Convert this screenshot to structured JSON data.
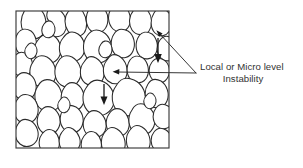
{
  "figure": {
    "kind": "granular-soil-fabric-diagram",
    "background_color": "#ffffff",
    "annotation": {
      "line1": "Local or Micro level",
      "line2": "Instability"
    },
    "colors": {
      "grain_stroke": "#2b2b2b",
      "box_stroke": "#3a3a3a",
      "arrow": "#1a1a1a",
      "leader": "#2b2b2b",
      "text": "#333333"
    },
    "sample_box": {
      "x": 16,
      "y": 11,
      "width": 153,
      "height": 137
    },
    "load_arrows": [
      {
        "name": "upper-right-load-arrow",
        "x": 158,
        "y_start": 38,
        "y_end": 62
      },
      {
        "name": "center-load-arrow",
        "x": 104,
        "y_start": 84,
        "y_end": 104
      }
    ],
    "leader_lines": [
      {
        "name": "diagonal-leader",
        "from_x": 196,
        "from_y": 73,
        "to_x": 157,
        "to_y": 31
      },
      {
        "name": "horizontal-leader",
        "from_x": 196,
        "from_y": 73,
        "to_x": 114,
        "to_y": 72
      }
    ],
    "grain_count": 42
  }
}
